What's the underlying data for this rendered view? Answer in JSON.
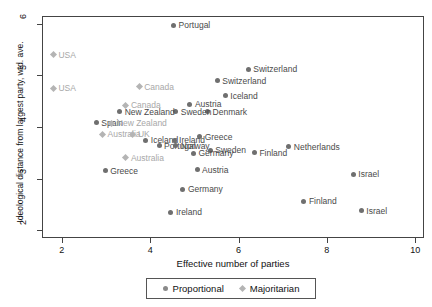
{
  "chart_data": {
    "type": "scatter",
    "title": "",
    "xlabel": "Effective number of parties",
    "ylabel": "Ideological distance from largest party, wtd. ave.",
    "xlim": [
      1.55,
      10.2
    ],
    "ylim": [
      1.85,
      6.15
    ],
    "xticks": [
      "2",
      "4",
      "6",
      "8",
      "10"
    ],
    "xtick_values": [
      2,
      4,
      6,
      8,
      10
    ],
    "yticks": [
      "2",
      "3",
      "4",
      "5",
      "6"
    ],
    "ytick_values": [
      2,
      3,
      4,
      5,
      6
    ],
    "grid": false,
    "legend_position": "bottom",
    "series": [
      {
        "name": "Proportional",
        "marker": "circle",
        "color": "#6f6f6f",
        "points": [
          {
            "label": "Portugal",
            "x": 4.53,
            "y": 5.97
          },
          {
            "label": "Switzerland",
            "x": 6.22,
            "y": 5.12
          },
          {
            "label": "Switzerland",
            "x": 5.52,
            "y": 4.9
          },
          {
            "label": "Iceland",
            "x": 5.7,
            "y": 4.61
          },
          {
            "label": "Austria",
            "x": 4.9,
            "y": 4.44
          },
          {
            "label": "Denmark",
            "x": 5.3,
            "y": 4.3
          },
          {
            "label": "Sweden",
            "x": 4.58,
            "y": 4.3
          },
          {
            "label": "New Zealand",
            "x": 3.31,
            "y": 4.3
          },
          {
            "label": "Spain",
            "x": 2.78,
            "y": 4.08
          },
          {
            "label": "Greece",
            "x": 5.12,
            "y": 3.81
          },
          {
            "label": "Netherlands",
            "x": 7.14,
            "y": 3.62
          },
          {
            "label": "Iceland",
            "x": 3.9,
            "y": 3.74
          },
          {
            "label": "Ireland",
            "x": 4.54,
            "y": 3.74
          },
          {
            "label": "Portugal",
            "x": 4.2,
            "y": 3.64
          },
          {
            "label": "Norway",
            "x": 4.58,
            "y": 3.64
          },
          {
            "label": "Sweden",
            "x": 5.36,
            "y": 3.55
          },
          {
            "label": "Germany",
            "x": 4.98,
            "y": 3.49
          },
          {
            "label": "Finland",
            "x": 6.36,
            "y": 3.5
          },
          {
            "label": "Greece",
            "x": 2.98,
            "y": 3.15
          },
          {
            "label": "Austria",
            "x": 5.06,
            "y": 3.17
          },
          {
            "label": "Israel",
            "x": 8.6,
            "y": 3.08
          },
          {
            "label": "Germany",
            "x": 4.74,
            "y": 2.79
          },
          {
            "label": "Finland",
            "x": 7.48,
            "y": 2.56
          },
          {
            "label": "Israel",
            "x": 8.78,
            "y": 2.38
          },
          {
            "label": "Ireland",
            "x": 4.47,
            "y": 2.35
          }
        ]
      },
      {
        "name": "Majoritarian",
        "marker": "diamond",
        "color": "#b4b4b4",
        "points": [
          {
            "label": "USA",
            "x": 1.81,
            "y": 5.4
          },
          {
            "label": "USA",
            "x": 1.81,
            "y": 4.75
          },
          {
            "label": "Canada",
            "x": 3.75,
            "y": 4.78
          },
          {
            "label": "Canada",
            "x": 3.45,
            "y": 4.42
          },
          {
            "label": "New Zealand",
            "x": 3.13,
            "y": 4.07
          },
          {
            "label": "Australia",
            "x": 2.92,
            "y": 3.86
          },
          {
            "label": "UK",
            "x": 3.61,
            "y": 3.86
          },
          {
            "label": "Australia",
            "x": 3.45,
            "y": 3.4
          }
        ]
      }
    ],
    "legend": [
      {
        "label": "Proportional",
        "marker": "circle"
      },
      {
        "label": "Majoritarian",
        "marker": "diamond"
      }
    ]
  }
}
